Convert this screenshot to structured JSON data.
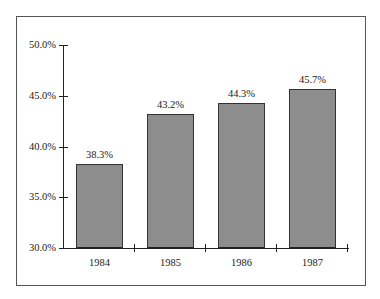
{
  "chart_data": {
    "type": "bar",
    "title": "",
    "xlabel": "",
    "ylabel": "",
    "categories": [
      "1984",
      "1985",
      "1986",
      "1987"
    ],
    "values": [
      38.3,
      43.2,
      44.3,
      45.7
    ],
    "value_labels": [
      "38.3%",
      "43.2%",
      "44.3%",
      "45.7%"
    ],
    "ylim": [
      30,
      50
    ],
    "yticks": [
      30,
      35,
      40,
      45,
      50
    ],
    "ytick_labels": [
      "30.0%",
      "35.0%",
      "40.0%",
      "45.0%",
      "50.0%"
    ],
    "grid": false,
    "legend": null,
    "bar_color": "#8d8d8d"
  }
}
